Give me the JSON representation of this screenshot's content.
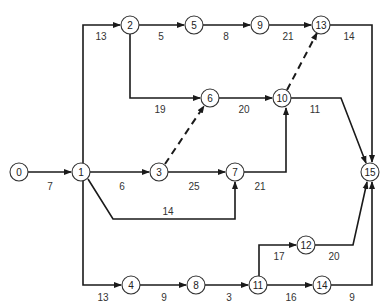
{
  "diagram": {
    "type": "activity-network",
    "nodes": [
      {
        "id": "0",
        "x": 19,
        "y": 172
      },
      {
        "id": "1",
        "x": 81,
        "y": 172
      },
      {
        "id": "2",
        "x": 130,
        "y": 25
      },
      {
        "id": "3",
        "x": 159,
        "y": 172
      },
      {
        "id": "4",
        "x": 131,
        "y": 285
      },
      {
        "id": "5",
        "x": 194,
        "y": 25
      },
      {
        "id": "6",
        "x": 210,
        "y": 98
      },
      {
        "id": "7",
        "x": 235,
        "y": 172
      },
      {
        "id": "8",
        "x": 196,
        "y": 285
      },
      {
        "id": "9",
        "x": 260,
        "y": 25
      },
      {
        "id": "10",
        "x": 282,
        "y": 98
      },
      {
        "id": "11",
        "x": 258,
        "y": 285
      },
      {
        "id": "12",
        "x": 306,
        "y": 245
      },
      {
        "id": "13",
        "x": 321,
        "y": 25
      },
      {
        "id": "14",
        "x": 322,
        "y": 285
      },
      {
        "id": "15",
        "x": 370,
        "y": 172
      }
    ],
    "edges": [
      {
        "from": "0",
        "to": "1",
        "duration": "7",
        "dashed": false,
        "label_x": 50,
        "label_y": 187
      },
      {
        "from": "1",
        "to": "2",
        "duration": "13",
        "dashed": false,
        "label_x": 101,
        "label_y": 37
      },
      {
        "from": "1",
        "to": "3",
        "duration": "6",
        "dashed": false,
        "label_x": 122,
        "label_y": 187
      },
      {
        "from": "1",
        "to": "7",
        "duration": "14",
        "dashed": false,
        "label_x": 168,
        "label_y": 215
      },
      {
        "from": "1",
        "to": "4",
        "duration": "13",
        "dashed": false,
        "label_x": 103,
        "label_y": 298
      },
      {
        "from": "2",
        "to": "5",
        "duration": "5",
        "dashed": false,
        "label_x": 161,
        "label_y": 37
      },
      {
        "from": "2",
        "to": "6",
        "duration": "19",
        "dashed": false,
        "label_x": 160,
        "label_y": 110
      },
      {
        "from": "3",
        "to": "6",
        "duration": "",
        "dashed": true
      },
      {
        "from": "3",
        "to": "7",
        "duration": "25",
        "dashed": false,
        "label_x": 194,
        "label_y": 187
      },
      {
        "from": "5",
        "to": "9",
        "duration": "8",
        "dashed": false,
        "label_x": 226,
        "label_y": 37
      },
      {
        "from": "6",
        "to": "10",
        "duration": "20",
        "dashed": false,
        "label_x": 244,
        "label_y": 110
      },
      {
        "from": "7",
        "to": "10",
        "duration": "21",
        "dashed": false,
        "label_x": 260,
        "label_y": 187
      },
      {
        "from": "9",
        "to": "13",
        "duration": "21",
        "dashed": false,
        "label_x": 288,
        "label_y": 37
      },
      {
        "from": "10",
        "to": "13",
        "duration": "",
        "dashed": true
      },
      {
        "from": "10",
        "to": "15",
        "duration": "11",
        "dashed": false,
        "label_x": 315,
        "label_y": 110
      },
      {
        "from": "13",
        "to": "15",
        "duration": "14",
        "dashed": false,
        "label_x": 349,
        "label_y": 37
      },
      {
        "from": "4",
        "to": "8",
        "duration": "9",
        "dashed": false,
        "label_x": 164,
        "label_y": 298
      },
      {
        "from": "8",
        "to": "11",
        "duration": "3",
        "dashed": false,
        "label_x": 229,
        "label_y": 298
      },
      {
        "from": "11",
        "to": "12",
        "duration": "17",
        "dashed": false,
        "label_x": 279,
        "label_y": 257
      },
      {
        "from": "11",
        "to": "14",
        "duration": "16",
        "dashed": false,
        "label_x": 291,
        "label_y": 298
      },
      {
        "from": "12",
        "to": "15",
        "duration": "20",
        "dashed": false,
        "label_x": 334,
        "label_y": 257
      },
      {
        "from": "14",
        "to": "15",
        "duration": "9",
        "dashed": false,
        "label_x": 352,
        "label_y": 298
      }
    ]
  }
}
